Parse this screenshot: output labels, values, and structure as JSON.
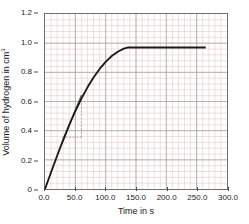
{
  "chart_data": {
    "type": "line",
    "title": "",
    "xlabel": "Time in s",
    "ylabel": "Volume of hydrogen in cm",
    "ylabel_superscript": "3",
    "xlim": [
      0.0,
      300.0
    ],
    "ylim": [
      0.0,
      1.2
    ],
    "grid": true,
    "legend": "none",
    "xticks": [
      0.0,
      50.0,
      100.0,
      150.0,
      200.0,
      250.0,
      300.0
    ],
    "xtick_labels": [
      "0.0",
      "50.0",
      "100.0",
      "150.0",
      "200.0",
      "250.0",
      "300.0"
    ],
    "yticks": [
      0.0,
      0.2,
      0.4,
      0.6,
      0.8,
      1.0,
      1.2
    ],
    "ytick_labels": [
      "0",
      "0.2",
      "0.4",
      "0.6",
      "0.8",
      "1.0",
      "1.2"
    ],
    "minor_grid_step_x": 10.0,
    "minor_grid_step_y": 0.04,
    "grid_color": "#e8c9c9",
    "major_grid_color": "#a8a8a8",
    "curve_color": "#1a1a1a",
    "series": [
      {
        "name": "Volume of hydrogen evolved",
        "x": [
          0,
          10,
          20,
          30,
          40,
          50,
          60,
          70,
          80,
          90,
          100,
          110,
          120,
          130,
          136,
          150,
          180,
          210,
          240,
          265
        ],
        "y": [
          0.0,
          0.115,
          0.228,
          0.337,
          0.44,
          0.535,
          0.62,
          0.697,
          0.765,
          0.823,
          0.872,
          0.912,
          0.941,
          0.962,
          0.97,
          0.97,
          0.97,
          0.97,
          0.97,
          0.97
        ]
      }
    ],
    "annotations": [
      {
        "name": "tangent-line",
        "type": "line",
        "x": [
          28,
          60
        ],
        "y": [
          0.31,
          0.645
        ],
        "style": "solid",
        "color": "#555555"
      },
      {
        "name": "gradient-triangle-horizontal",
        "type": "line",
        "x": [
          28,
          60
        ],
        "y": [
          0.355,
          0.355
        ],
        "style": "dashed",
        "color": "#9a9a9a"
      },
      {
        "name": "gradient-triangle-vertical",
        "type": "line",
        "x": [
          60,
          60
        ],
        "y": [
          0.355,
          0.645
        ],
        "style": "dashed",
        "color": "#9a9a9a"
      }
    ],
    "plateau_value": 0.97,
    "plateau_start_time": 136.0,
    "curve_end_time": 265.0
  }
}
